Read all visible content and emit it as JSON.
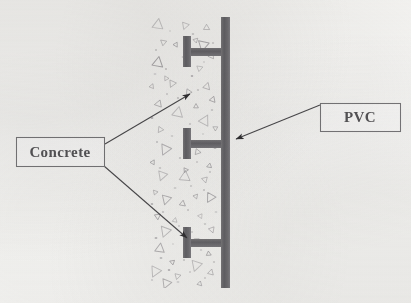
{
  "figure": {
    "kind": "technical-cross-section-diagram",
    "background_color": "#fdfdfc"
  },
  "labels": {
    "concrete": {
      "text": "Concrete",
      "box": {
        "x": 16,
        "y": 137,
        "w": 88,
        "h": 29
      },
      "border_color": "#7b7a7d",
      "text_color": "#58575a",
      "font_size": 15
    },
    "pvc": {
      "text": "PVC",
      "box": {
        "x": 320,
        "y": 103,
        "w": 80,
        "h": 28
      },
      "border_color": "#7b7a7d",
      "text_color": "#58575a",
      "font_size": 15
    }
  },
  "leader_lines": [
    {
      "name": "concrete-arrow-upper",
      "from": {
        "x": 105,
        "y": 144
      },
      "to": {
        "x": 190,
        "y": 94
      },
      "points_to": "concrete-region-upper",
      "color": "#4d4c4f"
    },
    {
      "name": "concrete-arrow-lower",
      "from": {
        "x": 104,
        "y": 166
      },
      "to": {
        "x": 187,
        "y": 238
      },
      "points_to": "concrete-region-lower",
      "color": "#4d4c4f"
    },
    {
      "name": "pvc-arrow",
      "from": {
        "x": 320,
        "y": 105
      },
      "to": {
        "x": 236,
        "y": 139
      },
      "points_to": "pvc-wall",
      "color": "#4d4c4f"
    }
  ],
  "pvc_wall": {
    "name": "pvc-wall-panel",
    "color": "#6e6d70",
    "x": 221,
    "y": 17,
    "width": 9,
    "height": 271
  },
  "pvc_ribs": [
    {
      "name": "pvc-rib-top",
      "web_y": 48,
      "web_x": 190,
      "web_w": 31,
      "web_h": 8,
      "flange_x": 183,
      "flange_y": 36,
      "flange_w": 8,
      "flange_h": 31
    },
    {
      "name": "pvc-rib-middle",
      "web_y": 140,
      "web_x": 190,
      "web_w": 31,
      "web_h": 8,
      "flange_x": 183,
      "flange_y": 128,
      "flange_w": 8,
      "flange_h": 31
    },
    {
      "name": "pvc-rib-bottom",
      "web_y": 239,
      "web_x": 190,
      "web_w": 31,
      "web_h": 8,
      "flange_x": 183,
      "flange_y": 227,
      "flange_w": 8,
      "flange_h": 31
    }
  ],
  "concrete_region": {
    "name": "concrete-fill-region",
    "x": 149,
    "y": 17,
    "width": 72,
    "height": 271,
    "aggregate_color": "#9e9ca0",
    "speck_color": "#a9a7ab"
  },
  "concrete_aggregate": [
    {
      "x": 158,
      "y": 24,
      "s": 9,
      "r": 8
    },
    {
      "x": 185,
      "y": 26,
      "s": 6,
      "r": 200
    },
    {
      "x": 207,
      "y": 28,
      "s": 5,
      "r": 120
    },
    {
      "x": 163,
      "y": 42,
      "s": 5,
      "r": 310
    },
    {
      "x": 196,
      "y": 40,
      "s": 4,
      "r": 45
    },
    {
      "x": 211,
      "y": 56,
      "s": 5,
      "r": 265
    },
    {
      "x": 176,
      "y": 45,
      "s": 4,
      "r": 150
    },
    {
      "x": 203,
      "y": 46,
      "s": 9,
      "r": 192
    },
    {
      "x": 158,
      "y": 62,
      "s": 9,
      "r": 10
    },
    {
      "x": 200,
      "y": 68,
      "s": 5,
      "r": 70
    },
    {
      "x": 166,
      "y": 78,
      "s": 4,
      "r": 330
    },
    {
      "x": 152,
      "y": 86,
      "s": 4,
      "r": 22
    },
    {
      "x": 172,
      "y": 84,
      "s": 6,
      "r": 205
    },
    {
      "x": 207,
      "y": 86,
      "s": 6,
      "r": 18
    },
    {
      "x": 189,
      "y": 92,
      "s": 5,
      "r": 95
    },
    {
      "x": 158,
      "y": 104,
      "s": 6,
      "r": 260
    },
    {
      "x": 196,
      "y": 106,
      "s": 4,
      "r": 0
    },
    {
      "x": 213,
      "y": 100,
      "s": 5,
      "r": 140
    },
    {
      "x": 178,
      "y": 112,
      "s": 9,
      "r": 12
    },
    {
      "x": 205,
      "y": 120,
      "s": 9,
      "r": 28
    },
    {
      "x": 160,
      "y": 130,
      "s": 5,
      "r": 215
    },
    {
      "x": 215,
      "y": 128,
      "s": 4,
      "r": 300
    },
    {
      "x": 165,
      "y": 150,
      "s": 9,
      "r": 205
    },
    {
      "x": 198,
      "y": 152,
      "s": 5,
      "r": 100
    },
    {
      "x": 153,
      "y": 162,
      "s": 4,
      "r": 30
    },
    {
      "x": 209,
      "y": 166,
      "s": 4,
      "r": 250
    },
    {
      "x": 186,
      "y": 170,
      "s": 4,
      "r": 85
    },
    {
      "x": 162,
      "y": 176,
      "s": 8,
      "r": 200
    },
    {
      "x": 185,
      "y": 176,
      "s": 9,
      "r": 5
    },
    {
      "x": 205,
      "y": 180,
      "s": 5,
      "r": 165
    },
    {
      "x": 155,
      "y": 192,
      "s": 4,
      "r": 320
    },
    {
      "x": 196,
      "y": 196,
      "s": 4,
      "r": 40
    },
    {
      "x": 166,
      "y": 200,
      "s": 8,
      "r": 196
    },
    {
      "x": 210,
      "y": 198,
      "s": 8,
      "r": 210
    },
    {
      "x": 183,
      "y": 204,
      "s": 5,
      "r": 130
    },
    {
      "x": 158,
      "y": 216,
      "s": 5,
      "r": 55
    },
    {
      "x": 200,
      "y": 216,
      "s": 4,
      "r": 275
    },
    {
      "x": 175,
      "y": 220,
      "s": 4,
      "r": 12
    },
    {
      "x": 165,
      "y": 232,
      "s": 9,
      "r": 200
    },
    {
      "x": 212,
      "y": 230,
      "s": 5,
      "r": 160
    },
    {
      "x": 197,
      "y": 240,
      "s": 4,
      "r": 60
    },
    {
      "x": 160,
      "y": 248,
      "s": 8,
      "r": 8
    },
    {
      "x": 186,
      "y": 252,
      "s": 5,
      "r": 230
    },
    {
      "x": 209,
      "y": 254,
      "s": 4,
      "r": 115
    },
    {
      "x": 172,
      "y": 262,
      "s": 4,
      "r": 290
    },
    {
      "x": 196,
      "y": 266,
      "s": 9,
      "r": 198
    },
    {
      "x": 155,
      "y": 272,
      "s": 9,
      "r": 206
    },
    {
      "x": 178,
      "y": 276,
      "s": 5,
      "r": 75
    },
    {
      "x": 211,
      "y": 272,
      "s": 5,
      "r": 15
    },
    {
      "x": 166,
      "y": 284,
      "s": 8,
      "r": 202
    },
    {
      "x": 200,
      "y": 284,
      "s": 4,
      "r": 135
    }
  ],
  "concrete_specks": [
    {
      "x": 170,
      "y": 31
    },
    {
      "x": 193,
      "y": 34
    },
    {
      "x": 156,
      "y": 50
    },
    {
      "x": 183,
      "y": 57
    },
    {
      "x": 213,
      "y": 43
    },
    {
      "x": 166,
      "y": 69
    },
    {
      "x": 192,
      "y": 76
    },
    {
      "x": 204,
      "y": 62
    },
    {
      "x": 155,
      "y": 74
    },
    {
      "x": 178,
      "y": 98
    },
    {
      "x": 198,
      "y": 90
    },
    {
      "x": 212,
      "y": 110
    },
    {
      "x": 167,
      "y": 94
    },
    {
      "x": 152,
      "y": 118
    },
    {
      "x": 190,
      "y": 124
    },
    {
      "x": 203,
      "y": 134
    },
    {
      "x": 172,
      "y": 136
    },
    {
      "x": 157,
      "y": 142
    },
    {
      "x": 215,
      "y": 148
    },
    {
      "x": 180,
      "y": 158
    },
    {
      "x": 197,
      "y": 162
    },
    {
      "x": 160,
      "y": 168
    },
    {
      "x": 210,
      "y": 172
    },
    {
      "x": 175,
      "y": 188
    },
    {
      "x": 191,
      "y": 186
    },
    {
      "x": 204,
      "y": 190
    },
    {
      "x": 152,
      "y": 204
    },
    {
      "x": 188,
      "y": 210
    },
    {
      "x": 216,
      "y": 212
    },
    {
      "x": 163,
      "y": 212
    },
    {
      "x": 179,
      "y": 226
    },
    {
      "x": 205,
      "y": 224
    },
    {
      "x": 192,
      "y": 232
    },
    {
      "x": 156,
      "y": 238
    },
    {
      "x": 216,
      "y": 244
    },
    {
      "x": 173,
      "y": 244
    },
    {
      "x": 201,
      "y": 250
    },
    {
      "x": 184,
      "y": 260
    },
    {
      "x": 161,
      "y": 258
    },
    {
      "x": 214,
      "y": 262
    },
    {
      "x": 190,
      "y": 272
    },
    {
      "x": 169,
      "y": 270
    },
    {
      "x": 205,
      "y": 278
    },
    {
      "x": 178,
      "y": 282
    },
    {
      "x": 152,
      "y": 280
    }
  ]
}
